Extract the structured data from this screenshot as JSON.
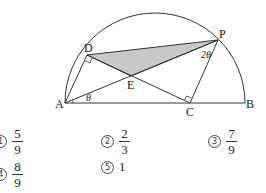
{
  "figure": {
    "points": {
      "A": {
        "label": "A",
        "x": 65,
        "y": 103
      },
      "B": {
        "label": "B",
        "x": 245,
        "y": 103
      },
      "C": {
        "label": "C",
        "x": 190,
        "y": 103
      },
      "D": {
        "label": "D",
        "x": 87,
        "y": 55
      },
      "E": {
        "label": "E",
        "x": 131,
        "y": 76
      },
      "P": {
        "label": "P",
        "x": 218,
        "y": 40
      }
    },
    "angles": {
      "theta": "θ",
      "two_theta": "2θ"
    },
    "colors": {
      "shaded": "#c8c8c8",
      "stroke": "#333333"
    }
  },
  "choices": [
    {
      "marker": "1",
      "numerator": "5",
      "denominator": "9"
    },
    {
      "marker": "2",
      "numerator": "2",
      "denominator": "3"
    },
    {
      "marker": "3",
      "numerator": "7",
      "denominator": "9"
    },
    {
      "marker": "4",
      "numerator": "8",
      "denominator": "9"
    },
    {
      "marker": "5",
      "value": "1"
    }
  ]
}
